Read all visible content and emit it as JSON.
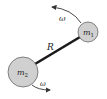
{
  "diagram": {
    "masses": [
      {
        "id": "m1",
        "label_base": "m",
        "label_sub": "1"
      },
      {
        "id": "m2",
        "label_base": "m",
        "label_sub": "2"
      }
    ],
    "rod_label": "R",
    "angular_velocity_label": "ω",
    "colors": {
      "mass_fill": "#d0d0d0",
      "mass_stroke": "#555555",
      "rod": "#1a1a1a",
      "arrow": "#333333",
      "text": "#222222"
    }
  }
}
